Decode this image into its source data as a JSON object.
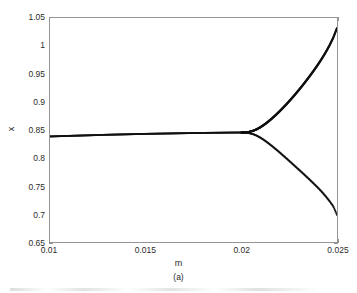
{
  "chart_data": {
    "type": "line",
    "title": "",
    "subtitle": "",
    "xlabel": "m",
    "ylabel": "x",
    "caption": "(a)",
    "xlim": [
      0.01,
      0.025
    ],
    "ylim": [
      0.65,
      1.05
    ],
    "xticks": [
      "0.01",
      "0.015",
      "0.02",
      "0.025"
    ],
    "xtick_values": [
      0.01,
      0.015,
      0.02,
      0.025
    ],
    "yticks": [
      "0.65",
      "0.7",
      "0.75",
      "0.8",
      "0.85",
      "0.9",
      "0.95",
      "1",
      "1.05"
    ],
    "ytick_values": [
      0.65,
      0.7,
      0.75,
      0.8,
      0.85,
      0.9,
      0.95,
      1.0,
      1.05
    ],
    "grid": false,
    "legend": null,
    "legend_position": "none",
    "marker": "dot",
    "line_color": "#111111",
    "axis_color": "#949494",
    "background_color": "#ffffff",
    "bifurcation_point": {
      "m": 0.0204,
      "x": 0.8455
    },
    "series": [
      {
        "name": "stable-lower-branch-and-trunk",
        "comment": "trunk from m=0.01 to bifurcation, then descending lower branch",
        "x": [
          0.01,
          0.0105,
          0.011,
          0.0115,
          0.012,
          0.0125,
          0.013,
          0.0135,
          0.014,
          0.0145,
          0.015,
          0.0155,
          0.016,
          0.0165,
          0.017,
          0.0175,
          0.018,
          0.0185,
          0.019,
          0.0195,
          0.02,
          0.0202,
          0.0204,
          0.0206,
          0.0208,
          0.021,
          0.0212,
          0.0214,
          0.0216,
          0.0218,
          0.022,
          0.0222,
          0.0224,
          0.0226,
          0.0228,
          0.023,
          0.0232,
          0.0234,
          0.0236,
          0.0238,
          0.024,
          0.0242,
          0.0244,
          0.0246,
          0.0248,
          0.025
        ],
        "values": [
          0.8385,
          0.839,
          0.8395,
          0.84,
          0.8405,
          0.841,
          0.8415,
          0.8419,
          0.8423,
          0.8427,
          0.8431,
          0.8434,
          0.8437,
          0.844,
          0.8443,
          0.8446,
          0.8448,
          0.845,
          0.8452,
          0.8454,
          0.8455,
          0.8452,
          0.8445,
          0.8428,
          0.84,
          0.8362,
          0.8318,
          0.8268,
          0.8214,
          0.8158,
          0.81,
          0.804,
          0.798,
          0.7918,
          0.7856,
          0.7794,
          0.7732,
          0.7668,
          0.7604,
          0.7538,
          0.747,
          0.7398,
          0.732,
          0.7234,
          0.714,
          0.6985
        ]
      },
      {
        "name": "stable-upper-branch",
        "comment": "ascending upper branch emerging from bifurcation",
        "x": [
          0.02,
          0.0202,
          0.0204,
          0.0206,
          0.0208,
          0.021,
          0.0212,
          0.0214,
          0.0216,
          0.0218,
          0.022,
          0.0222,
          0.0224,
          0.0226,
          0.0228,
          0.023,
          0.0232,
          0.0234,
          0.0236,
          0.0238,
          0.024,
          0.0242,
          0.0244,
          0.0246,
          0.0248,
          0.025
        ],
        "values": [
          0.8455,
          0.8458,
          0.8466,
          0.8484,
          0.8512,
          0.855,
          0.8596,
          0.8648,
          0.8706,
          0.8768,
          0.8834,
          0.8904,
          0.8976,
          0.9052,
          0.913,
          0.9212,
          0.9296,
          0.9384,
          0.9474,
          0.9568,
          0.9666,
          0.977,
          0.9882,
          1.0005,
          1.0145,
          1.032
        ]
      }
    ]
  }
}
